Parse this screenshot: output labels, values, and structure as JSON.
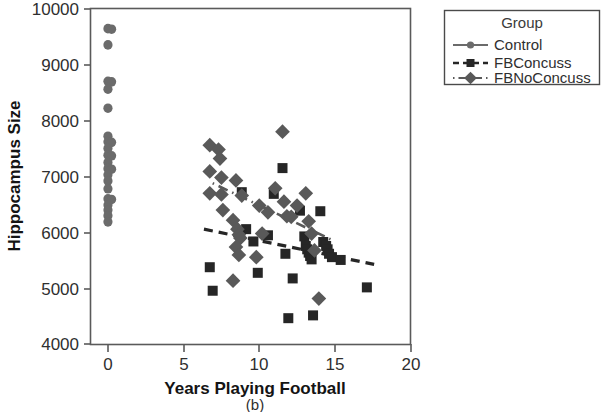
{
  "caption": "(b)",
  "colors": {
    "control_marker": "#6b6b6b",
    "concuss_marker": "#262626",
    "noconcuss_marker": "#595959",
    "axis": "#5a5a5a",
    "text": "#2f2f2f",
    "background": "#ffffff"
  },
  "legend": {
    "title": "Group",
    "position": "right-outside",
    "entries": [
      {
        "label": "Control",
        "marker": "circle",
        "line": "solid",
        "color": "#6b6b6b"
      },
      {
        "label": "FBConcuss",
        "marker": "square",
        "line": "dashed",
        "color": "#262626"
      },
      {
        "label": "FBNoConcuss",
        "marker": "diamond",
        "line": "dashdot",
        "color": "#595959"
      }
    ]
  },
  "chart_data": {
    "type": "scatter",
    "title": "",
    "xlabel": "Years Playing Football",
    "ylabel": "Hippocampus Size",
    "xlim": [
      -1.2,
      20.8
    ],
    "ylim": [
      4000,
      10000
    ],
    "xticks": [
      0,
      5,
      10,
      15,
      20
    ],
    "yticks": [
      4000,
      5000,
      6000,
      7000,
      8000,
      9000,
      10000
    ],
    "xticklabels": [
      "0",
      "5",
      "10",
      "15",
      "20"
    ],
    "yticklabels": [
      "4000",
      "5000",
      "6000",
      "7000",
      "8000",
      "9000",
      "10000"
    ],
    "grid": false,
    "series": [
      {
        "name": "Control",
        "marker": "circle",
        "color": "#6b6b6b",
        "points": [
          [
            0.0,
            9640
          ],
          [
            0.25,
            9630
          ],
          [
            0.0,
            9350
          ],
          [
            0.0,
            8700
          ],
          [
            0.25,
            8690
          ],
          [
            0.0,
            8560
          ],
          [
            0.0,
            8220
          ],
          [
            0.0,
            7720
          ],
          [
            0.0,
            7620
          ],
          [
            0.25,
            7610
          ],
          [
            0.0,
            7500
          ],
          [
            0.0,
            7380
          ],
          [
            0.25,
            7370
          ],
          [
            0.0,
            7250
          ],
          [
            0.0,
            7140
          ],
          [
            0.25,
            7130
          ],
          [
            0.0,
            7030
          ],
          [
            0.0,
            6920
          ],
          [
            0.0,
            6780
          ],
          [
            0.0,
            6600
          ],
          [
            0.25,
            6590
          ],
          [
            0.0,
            6490
          ],
          [
            0.0,
            6400
          ],
          [
            0.0,
            6300
          ],
          [
            0.0,
            6190
          ]
        ]
      },
      {
        "name": "FBConcuss",
        "marker": "square",
        "color": "#262626",
        "points": [
          [
            7.0,
            5380
          ],
          [
            7.2,
            4960
          ],
          [
            9.2,
            6720
          ],
          [
            9.5,
            6060
          ],
          [
            10.0,
            5840
          ],
          [
            10.3,
            5280
          ],
          [
            11.0,
            5950
          ],
          [
            11.4,
            6690
          ],
          [
            12.0,
            7150
          ],
          [
            12.2,
            5620
          ],
          [
            12.4,
            4470
          ],
          [
            12.7,
            5180
          ],
          [
            13.2,
            6390
          ],
          [
            13.5,
            5930
          ],
          [
            13.6,
            5760
          ],
          [
            13.7,
            5700
          ],
          [
            13.8,
            5640
          ],
          [
            13.9,
            5580
          ],
          [
            14.0,
            5520
          ],
          [
            14.1,
            4520
          ],
          [
            14.6,
            6380
          ],
          [
            14.8,
            5830
          ],
          [
            15.0,
            5760
          ],
          [
            15.1,
            5700
          ],
          [
            15.2,
            5620
          ],
          [
            15.4,
            5560
          ],
          [
            16.0,
            5510
          ],
          [
            17.8,
            5020
          ]
        ]
      },
      {
        "name": "FBNoConcuss",
        "marker": "diamond",
        "color": "#595959",
        "points": [
          [
            7.0,
            7560
          ],
          [
            7.6,
            7480
          ],
          [
            7.7,
            7320
          ],
          [
            7.0,
            7090
          ],
          [
            7.8,
            6980
          ],
          [
            8.8,
            6930
          ],
          [
            7.0,
            6700
          ],
          [
            7.8,
            6680
          ],
          [
            9.2,
            6660
          ],
          [
            7.9,
            6400
          ],
          [
            8.6,
            6220
          ],
          [
            8.9,
            6060
          ],
          [
            9.0,
            5960
          ],
          [
            9.1,
            5900
          ],
          [
            8.8,
            5740
          ],
          [
            9.0,
            5600
          ],
          [
            8.6,
            5140
          ],
          [
            10.4,
            6480
          ],
          [
            10.6,
            5980
          ],
          [
            11.0,
            6360
          ],
          [
            11.5,
            6790
          ],
          [
            12.0,
            7800
          ],
          [
            12.1,
            6550
          ],
          [
            12.3,
            6290
          ],
          [
            12.6,
            6280
          ],
          [
            13.0,
            6480
          ],
          [
            13.8,
            6200
          ],
          [
            14.0,
            5980
          ],
          [
            14.2,
            5680
          ],
          [
            14.5,
            4820
          ],
          [
            13.6,
            6700
          ],
          [
            10.2,
            5560
          ]
        ]
      }
    ],
    "trendlines": [
      {
        "name": "FBConcuss",
        "line": "dashed",
        "color": "#262626",
        "x": [
          6.6,
          18.3
        ],
        "y": [
          6060,
          5430
        ]
      },
      {
        "name": "FBNoConcuss",
        "line": "dashdot",
        "color": "#595959",
        "x": [
          7.2,
          15.3
        ],
        "y": [
          6880,
          5880
        ]
      }
    ]
  }
}
